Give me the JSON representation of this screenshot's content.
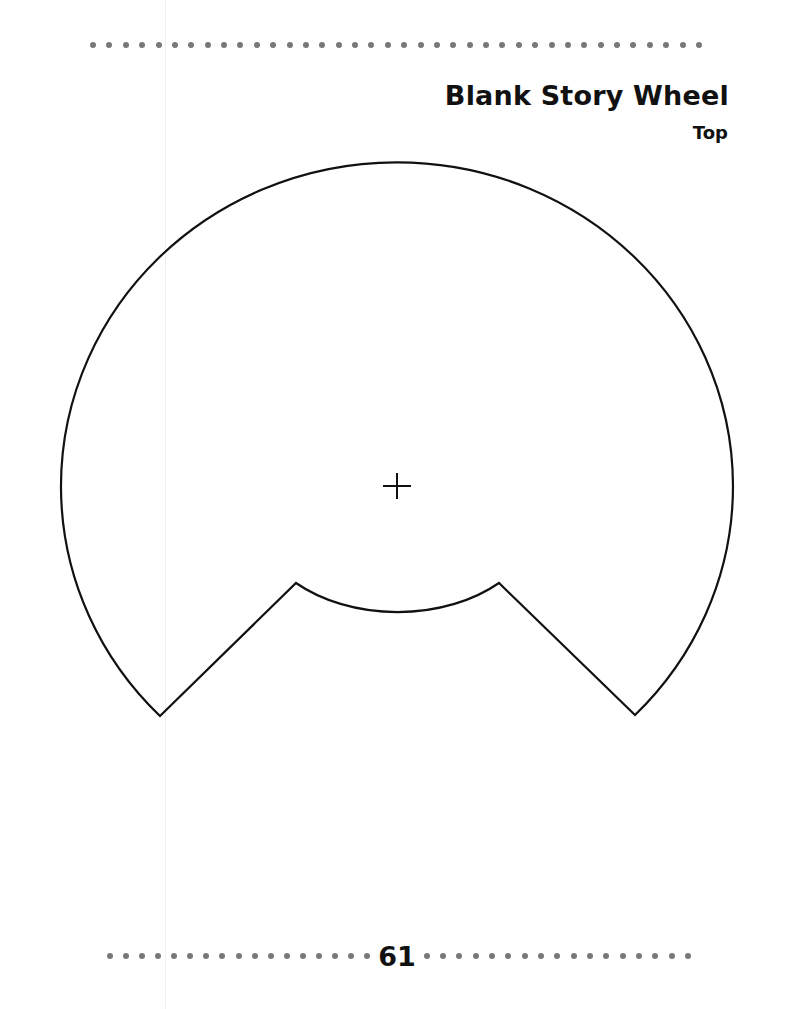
{
  "page": {
    "title": "Blank Story Wheel",
    "subtitle": "Top",
    "page_number": "61"
  },
  "decor": {
    "top_dot_count": 38,
    "footer_left_dot_count": 17,
    "footer_right_dot_count": 17,
    "dot_color": "#787878"
  },
  "wheel": {
    "stroke_color": "#111111",
    "center_mark": "crosshair-icon"
  }
}
